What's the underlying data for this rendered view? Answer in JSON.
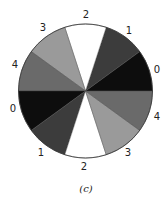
{
  "figure": {
    "caption": "(c)",
    "center": [
      85.5,
      91
    ],
    "radius": 67,
    "sector_count": 10,
    "sectors": [
      {
        "label": "0",
        "start_deg": 0,
        "end_deg": 36,
        "color": "#0d0d0d"
      },
      {
        "label": "1",
        "start_deg": 36,
        "end_deg": 72,
        "color": "#3c3c3c"
      },
      {
        "label": "2",
        "start_deg": 72,
        "end_deg": 108,
        "color": "#ffffff"
      },
      {
        "label": "3",
        "start_deg": 108,
        "end_deg": 144,
        "color": "#9a9a9a"
      },
      {
        "label": "4",
        "start_deg": 144,
        "end_deg": 180,
        "color": "#6a6a6a"
      },
      {
        "label": "0",
        "start_deg": 180,
        "end_deg": 216,
        "color": "#0d0d0d"
      },
      {
        "label": "1",
        "start_deg": 216,
        "end_deg": 252,
        "color": "#3c3c3c"
      },
      {
        "label": "2",
        "start_deg": 252,
        "end_deg": 288,
        "color": "#ffffff"
      },
      {
        "label": "3",
        "start_deg": 288,
        "end_deg": 324,
        "color": "#9a9a9a"
      },
      {
        "label": "4",
        "start_deg": 324,
        "end_deg": 360,
        "color": "#6a6a6a"
      }
    ],
    "labels": [
      {
        "text": "2",
        "x": 86,
        "y": 18
      },
      {
        "text": "1",
        "x": 129,
        "y": 34
      },
      {
        "text": "0",
        "x": 157,
        "y": 73
      },
      {
        "text": "4",
        "x": 157,
        "y": 120
      },
      {
        "text": "3",
        "x": 128,
        "y": 156
      },
      {
        "text": "2",
        "x": 84,
        "y": 170
      },
      {
        "text": "1",
        "x": 41,
        "y": 156
      },
      {
        "text": "0",
        "x": 13,
        "y": 112
      },
      {
        "text": "4",
        "x": 15,
        "y": 68
      },
      {
        "text": "3",
        "x": 43,
        "y": 31
      }
    ]
  }
}
